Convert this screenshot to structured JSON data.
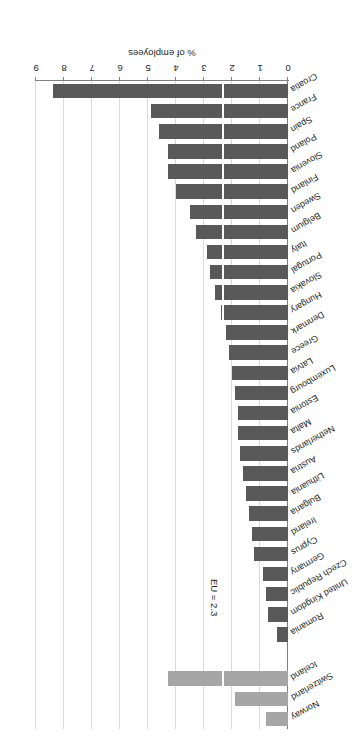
{
  "figure": {
    "title": "Figure 4.3: Precarious employment, 2016 (% of employees)"
  },
  "chart_data": {
    "type": "bar",
    "orientation": "horizontal",
    "title": "Figure 4.3: Precarious employment, 2016 (% of employees)",
    "xlabel": "% of employees",
    "ylabel": "",
    "xlim": [
      0,
      9
    ],
    "xticks": [
      "0",
      "1",
      "2",
      "3",
      "4",
      "5",
      "6",
      "7",
      "8",
      "9"
    ],
    "grid": true,
    "legend": "none",
    "annotations": [
      {
        "name": "eu-average-line",
        "label": "EU = 2.3",
        "value": 2.3,
        "color": "#ffffff"
      }
    ],
    "series_colors": {
      "eu": "#595959",
      "non_eu": "#a6a6a6"
    },
    "categories": [
      "Croatia",
      "France",
      "Spain",
      "Poland",
      "Slovenia",
      "Finland",
      "Sweden",
      "Belgium",
      "Italy",
      "Portugal",
      "Slovakia",
      "Hungary",
      "Denmark",
      "Greece",
      "Latvia",
      "Luxembourg",
      "Estonia",
      "Malta",
      "Netherlands",
      "Austria",
      "Lithuania",
      "Bulgaria",
      "Ireland",
      "Cyprus",
      "Germany",
      "Czech Republic",
      "United Kingdom",
      "Romania",
      "Iceland",
      "Switzerland",
      "Norway"
    ],
    "values": [
      8.4,
      4.9,
      4.6,
      4.3,
      4.3,
      4.0,
      3.5,
      3.3,
      2.9,
      2.8,
      2.6,
      2.4,
      2.2,
      2.1,
      2.0,
      1.9,
      1.8,
      1.8,
      1.7,
      1.6,
      1.5,
      1.4,
      1.3,
      1.2,
      0.9,
      0.8,
      0.7,
      0.4,
      4.3,
      1.9,
      0.8
    ],
    "groups": [
      "eu",
      "eu",
      "eu",
      "eu",
      "eu",
      "eu",
      "eu",
      "eu",
      "eu",
      "eu",
      "eu",
      "eu",
      "eu",
      "eu",
      "eu",
      "eu",
      "eu",
      "eu",
      "eu",
      "eu",
      "eu",
      "eu",
      "eu",
      "eu",
      "eu",
      "eu",
      "eu",
      "eu",
      "non_eu",
      "non_eu",
      "non_eu"
    ],
    "gap_after_index": 27
  }
}
